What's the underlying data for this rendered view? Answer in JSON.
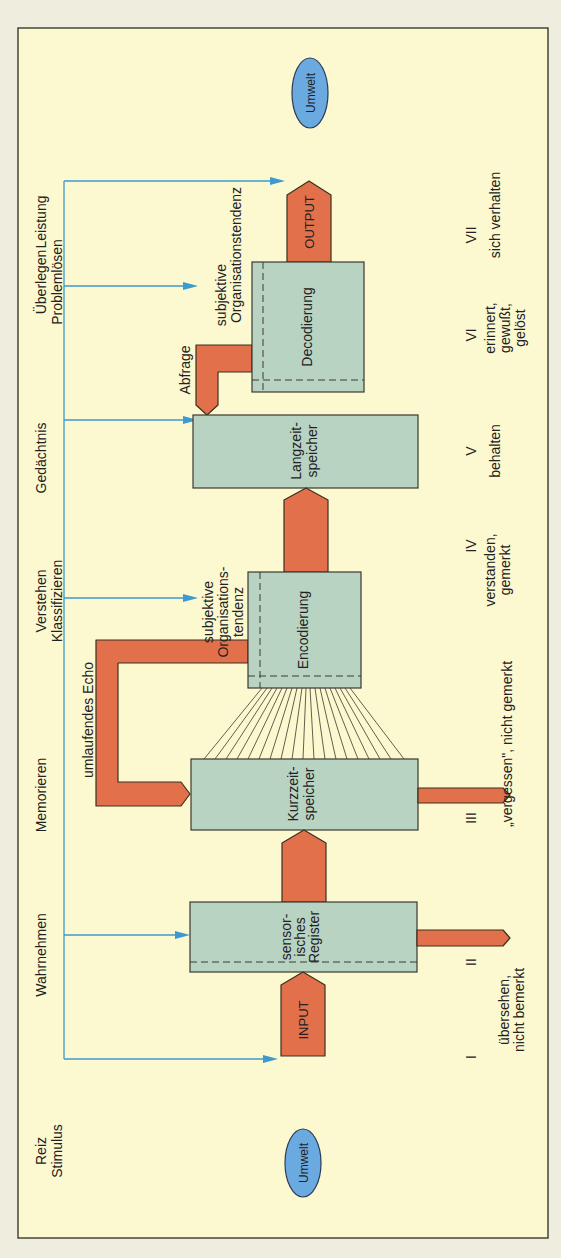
{
  "diagram": {
    "environment_top": "Umwelt",
    "environment_bottom": "Umwelt",
    "colors": {
      "background": "#fcf8cf",
      "box_fill": "#b9d3c2",
      "flow_arrow": "#e2714b",
      "feedback_line": "#3d9ad0",
      "environment": "#6aaae0"
    },
    "stage_labels": {
      "reiz": "Reiz",
      "stimulus": "Stimulus",
      "wahrnehmen": "Wahrnehmen",
      "memorieren": "Memorieren",
      "verstehen": "Verstehen",
      "klassifizieren": "Klassifizieren",
      "gedaechtnis": "Gedächtnis",
      "ueberlegen": "Überlegen",
      "problemloesen": "Problemlösen",
      "leistung": "Leistung"
    },
    "boxes": {
      "input": "INPUT",
      "sensor_line1": "sensor-",
      "sensor_line2": "isches",
      "sensor_line3": "Register",
      "kurz_line1": "Kurzzeit-",
      "kurz_line2": "speicher",
      "encodierung": "Encodierung",
      "lang_line1": "Langzeit-",
      "lang_line2": "speicher",
      "decodierung": "Decodierung",
      "output": "OUTPUT"
    },
    "annotations": {
      "echo": "umlaufendes Echo",
      "enc_org_line1": "subjektive",
      "enc_org_line2": "Organisations-",
      "enc_org_line3": "tendenz",
      "dec_org_line1": "subjektive",
      "dec_org_line2": "Organisationstendenz",
      "abfrage": "Abfrage"
    },
    "outcomes": [
      {
        "numeral": "I",
        "line1": "",
        "line2": "",
        "line3": ""
      },
      {
        "numeral": "II",
        "line1": "übersehen,",
        "line2": "nicht bemerkt",
        "line3": ""
      },
      {
        "numeral": "III",
        "line1": "„vergessen\", nicht gemerkt",
        "line2": "",
        "line3": ""
      },
      {
        "numeral": "IV",
        "line1": "verstanden,",
        "line2": "gemerkt",
        "line3": ""
      },
      {
        "numeral": "V",
        "line1": "behalten",
        "line2": "",
        "line3": ""
      },
      {
        "numeral": "VI",
        "line1": "erinnert,",
        "line2": "gewußt,",
        "line3": "gelöst"
      },
      {
        "numeral": "VII",
        "line1": "sich verhalten",
        "line2": "",
        "line3": ""
      }
    ]
  }
}
